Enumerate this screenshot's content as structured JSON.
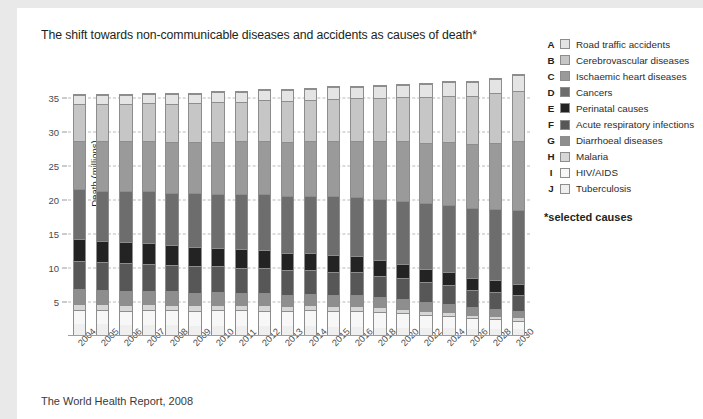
{
  "title": "The shift towards non-communicable diseases and accidents as causes of death*",
  "footer": "The World Health Report, 2008",
  "legend": {
    "note": "*selected causes",
    "items": [
      {
        "key": "A",
        "label": "Road traffic accidents",
        "color": "#e4e4e4"
      },
      {
        "key": "B",
        "label": "Cerebrovascular diseases",
        "color": "#c6c6c6"
      },
      {
        "key": "C",
        "label": "Ischaemic heart diseases",
        "color": "#9a9a9a"
      },
      {
        "key": "D",
        "label": "Cancers",
        "color": "#6d6d6d"
      },
      {
        "key": "E",
        "label": "Perinatal causes",
        "color": "#232323"
      },
      {
        "key": "F",
        "label": "Acute respiratory infections",
        "color": "#575757"
      },
      {
        "key": "G",
        "label": "Diarrhoeal diseases",
        "color": "#8e8e8e"
      },
      {
        "key": "H",
        "label": "Malaria",
        "color": "#d6d6d6"
      },
      {
        "key": "I",
        "label": "HIV/AIDS",
        "color": "#f7f7f7"
      },
      {
        "key": "J",
        "label": "Tuberculosis",
        "color": "#efefef"
      }
    ]
  },
  "chart_data": {
    "type": "bar",
    "stacked": true,
    "title": "The shift towards non-communicable diseases and accidents as causes of death*",
    "xlabel": "",
    "ylabel": "Death (millions)",
    "ylim": [
      0,
      40
    ],
    "yticks": [
      5,
      10,
      15,
      20,
      25,
      30,
      35
    ],
    "grid": true,
    "legend_position": "right",
    "categories": [
      "2004",
      "2005",
      "2006",
      "2007",
      "2008",
      "2009",
      "2010",
      "2011",
      "2012",
      "2013",
      "2014",
      "2015",
      "2016",
      "2018",
      "2020",
      "2022",
      "2024",
      "2026",
      "2028",
      "2030"
    ],
    "stack_order_bottom_to_top": [
      "Tuberculosis",
      "HIV/AIDS",
      "Malaria",
      "Diarrhoeal diseases",
      "Acute respiratory infections",
      "Perinatal causes",
      "Cancers",
      "Ischaemic heart diseases",
      "Cerebrovascular diseases",
      "Road traffic accidents"
    ],
    "series": [
      {
        "name": "Tuberculosis",
        "color": "#efefef",
        "values": [
          1.6,
          1.6,
          1.5,
          1.5,
          1.5,
          1.4,
          1.4,
          1.4,
          1.3,
          1.3,
          1.3,
          1.2,
          1.2,
          1.1,
          1.1,
          1.0,
          1.0,
          0.9,
          0.9,
          0.9
        ]
      },
      {
        "name": "HIV/AIDS",
        "color": "#f7f7f7",
        "values": [
          2.1,
          2.1,
          2.1,
          2.2,
          2.2,
          2.2,
          2.3,
          2.3,
          2.3,
          2.3,
          2.4,
          2.4,
          2.4,
          2.3,
          2.2,
          2.0,
          1.8,
          1.6,
          1.4,
          1.2
        ]
      },
      {
        "name": "Malaria",
        "color": "#d6d6d6",
        "values": [
          0.9,
          0.9,
          0.9,
          0.9,
          0.8,
          0.8,
          0.8,
          0.8,
          0.8,
          0.7,
          0.7,
          0.7,
          0.7,
          0.7,
          0.6,
          0.6,
          0.6,
          0.5,
          0.5,
          0.5
        ]
      },
      {
        "name": "Diarrhoeal diseases",
        "color": "#8e8e8e",
        "values": [
          2.2,
          2.1,
          2.1,
          2.0,
          2.0,
          1.9,
          1.9,
          1.8,
          1.8,
          1.7,
          1.7,
          1.6,
          1.6,
          1.5,
          1.4,
          1.3,
          1.2,
          1.1,
          1.1,
          1.0
        ]
      },
      {
        "name": "Acute respiratory infections",
        "color": "#575757",
        "values": [
          4.2,
          4.1,
          4.1,
          4.0,
          3.9,
          3.9,
          3.8,
          3.7,
          3.7,
          3.6,
          3.5,
          3.5,
          3.4,
          3.2,
          3.1,
          2.9,
          2.8,
          2.6,
          2.5,
          2.4
        ]
      },
      {
        "name": "Perinatal causes",
        "color": "#232323",
        "values": [
          3.2,
          3.1,
          3.1,
          3.0,
          2.9,
          2.9,
          2.8,
          2.7,
          2.7,
          2.6,
          2.5,
          2.5,
          2.4,
          2.3,
          2.1,
          2.0,
          1.9,
          1.8,
          1.7,
          1.6
        ]
      },
      {
        "name": "Cancers",
        "color": "#6d6d6d",
        "values": [
          7.4,
          7.5,
          7.6,
          7.7,
          7.8,
          7.9,
          8.0,
          8.2,
          8.3,
          8.4,
          8.5,
          8.7,
          8.8,
          9.1,
          9.4,
          9.7,
          10.0,
          10.3,
          10.6,
          11.0
        ]
      },
      {
        "name": "Ischaemic heart diseases",
        "color": "#9a9a9a",
        "values": [
          7.2,
          7.3,
          7.3,
          7.4,
          7.5,
          7.6,
          7.7,
          7.8,
          7.9,
          8.0,
          8.1,
          8.2,
          8.3,
          8.5,
          8.8,
          9.0,
          9.3,
          9.5,
          9.8,
          10.1
        ]
      },
      {
        "name": "Cerebrovascular diseases",
        "color": "#c6c6c6",
        "values": [
          5.5,
          5.6,
          5.6,
          5.7,
          5.7,
          5.8,
          5.9,
          5.9,
          6.0,
          6.1,
          6.1,
          6.2,
          6.3,
          6.4,
          6.6,
          6.8,
          6.9,
          7.1,
          7.3,
          7.5
        ]
      },
      {
        "name": "Road traffic accidents",
        "color": "#e4e4e4",
        "values": [
          1.3,
          1.3,
          1.3,
          1.4,
          1.4,
          1.4,
          1.5,
          1.5,
          1.5,
          1.6,
          1.6,
          1.7,
          1.7,
          1.8,
          1.8,
          1.9,
          2.0,
          2.1,
          2.2,
          2.3
        ]
      }
    ],
    "totals": [
      35.6,
      35.6,
      35.6,
      35.8,
      35.7,
      35.8,
      36.0,
      36.1,
      36.3,
      36.3,
      36.4,
      36.7,
      36.8,
      36.9,
      37.1,
      37.2,
      37.5,
      37.5,
      38.0,
      38.5
    ]
  }
}
